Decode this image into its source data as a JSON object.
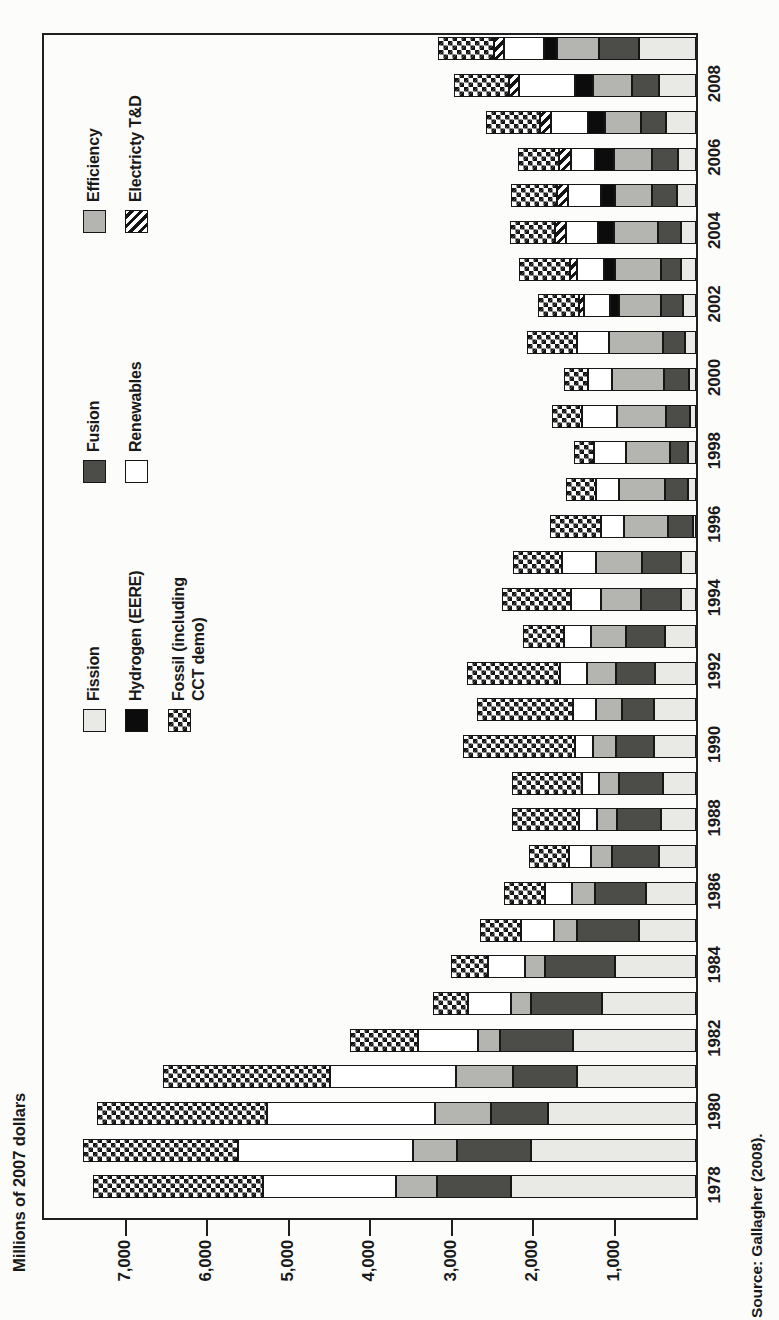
{
  "chart_data": {
    "type": "bar",
    "stacked": true,
    "orientation_note": "landscape stacked-column chart printed rotated 90 degrees counterclockwise on a portrait page",
    "title": "Millions of 2007 dollars",
    "source": "Source: Gallagher (2008).",
    "ylim": [
      0,
      8000
    ],
    "grid": false,
    "legend_position": "inside plot, upper area, three columns",
    "yticks": [
      7000,
      6000,
      5000,
      4000,
      3000,
      2000,
      1000
    ],
    "ytick_labels": [
      "7,000",
      "6,000",
      "5,000",
      "4,000",
      "3,000",
      "2,000",
      "1,000"
    ],
    "categories": [
      "1978",
      "1979",
      "1980",
      "1981",
      "1982",
      "1983",
      "1984",
      "1985",
      "1986",
      "1987",
      "1988",
      "1989",
      "1990",
      "1991",
      "1992",
      "1993",
      "1994",
      "1995",
      "1996",
      "1997",
      "1998",
      "1999",
      "2000",
      "2001",
      "2002",
      "2003",
      "2004",
      "2005",
      "2006",
      "2007",
      "2008",
      "2009"
    ],
    "xtick_labels": [
      "1978",
      "1980",
      "1982",
      "1984",
      "1986",
      "1988",
      "1990",
      "1992",
      "1994",
      "1996",
      "1998",
      "2000",
      "2002",
      "2004",
      "2006",
      "2008"
    ],
    "series": [
      {
        "name": "Fission",
        "pattern": "solid",
        "color": "#e9e9e6",
        "values": [
          2275,
          2030,
          1815,
          1460,
          1510,
          1155,
          1000,
          695,
          610,
          460,
          425,
          400,
          520,
          520,
          500,
          375,
          180,
          180,
          40,
          95,
          95,
          75,
          85,
          135,
          160,
          180,
          185,
          230,
          225,
          370,
          460,
          700
        ]
      },
      {
        "name": "Fusion",
        "pattern": "solid",
        "color": "#4c4c49",
        "values": [
          900,
          900,
          705,
          790,
          890,
          875,
          850,
          770,
          630,
          570,
          545,
          545,
          465,
          390,
          485,
          485,
          500,
          485,
          300,
          280,
          225,
          290,
          310,
          265,
          270,
          245,
          280,
          310,
          310,
          300,
          320,
          490
        ]
      },
      {
        "name": "Efficiency",
        "pattern": "solid",
        "color": "#b4b4b0",
        "values": [
          510,
          545,
          680,
          700,
          270,
          245,
          245,
          280,
          280,
          260,
          245,
          245,
          280,
          315,
          350,
          425,
          485,
          560,
          545,
          570,
          545,
          610,
          630,
          665,
          510,
          570,
          540,
          450,
          470,
          450,
          490,
          510
        ]
      },
      {
        "name": "Hydrogen (EERE)",
        "pattern": "solid",
        "color": "#0c0c0c",
        "values": [
          0,
          0,
          0,
          0,
          0,
          0,
          0,
          0,
          0,
          0,
          0,
          0,
          0,
          0,
          0,
          0,
          0,
          0,
          0,
          0,
          0,
          0,
          0,
          0,
          110,
          130,
          200,
          180,
          230,
          205,
          220,
          160
        ]
      },
      {
        "name": "Renewables",
        "pattern": "solid",
        "color": "#ffffff",
        "values": [
          1630,
          2145,
          2065,
          1545,
          740,
          525,
          460,
          400,
          330,
          270,
          220,
          205,
          220,
          290,
          330,
          330,
          365,
          425,
          280,
          280,
          390,
          425,
          300,
          400,
          330,
          340,
          390,
          400,
          300,
          450,
          680,
          500
        ]
      },
      {
        "name": "Electricty T&D",
        "pattern": "diagonal-stripes",
        "color": "#ffffff",
        "values": [
          0,
          0,
          0,
          0,
          0,
          0,
          0,
          0,
          0,
          0,
          0,
          0,
          0,
          0,
          0,
          0,
          0,
          0,
          0,
          0,
          0,
          0,
          0,
          0,
          60,
          85,
          130,
          135,
          145,
          145,
          120,
          120
        ]
      },
      {
        "name": "Fossil (including CCT demo)",
        "pattern": "checker",
        "color": "#ffffff",
        "values": [
          2090,
          1900,
          2090,
          2045,
          840,
          425,
          450,
          510,
          510,
          485,
          825,
          865,
          1375,
          1170,
          1140,
          510,
          850,
          595,
          630,
          365,
          245,
          365,
          290,
          610,
          500,
          620,
          560,
          560,
          510,
          655,
          680,
          680
        ]
      }
    ],
    "legend": {
      "columns": [
        [
          "Fission",
          "Hydrogen (EERE)",
          "Fossil (including\nCCT demo)"
        ],
        [
          "Fusion",
          "Renewables"
        ],
        [
          "Efficiency",
          "Electricty T&D"
        ]
      ]
    }
  }
}
